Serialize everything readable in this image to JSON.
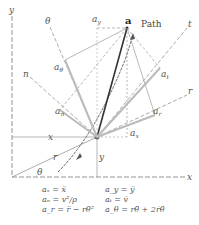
{
  "labels": {
    "y_axis": "y",
    "x_axis": "x",
    "theta_axis": "θ",
    "n_axis": "n",
    "t_axis": "t",
    "r_axis": "r",
    "point_a": "a",
    "path": "Path",
    "a_y": "a",
    "a_y_sub": "y",
    "a_theta": "a",
    "a_theta_sub": "θ",
    "a_t": "a",
    "a_t_sub": "t",
    "a_n": "a",
    "a_n_sub": "n",
    "a_r": "a",
    "a_r_sub": "r",
    "a_x": "a",
    "a_x_sub": "x",
    "x_dim": "x",
    "y_dim": "y",
    "r_dim": "r",
    "theta_angle": "θ"
  },
  "equations": [
    {
      "left": "aₓ = ẍ",
      "right": "a_y = ÿ"
    },
    {
      "left": "aₙ = v²/ρ",
      "right": "aₜ = v̇"
    },
    {
      "left": "a_r = r̈ − rθ̇²",
      "right": "a_θ = rθ̈ + 2ṙθ̇"
    }
  ],
  "colors": {
    "line": "#777777",
    "dark": "#333333",
    "highlight": "#bbbbbb"
  }
}
